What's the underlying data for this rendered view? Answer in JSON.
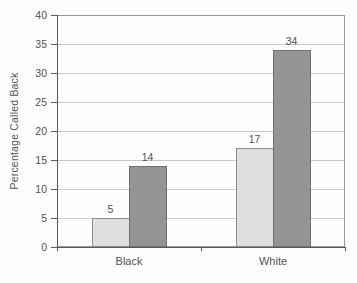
{
  "chart_data": {
    "type": "bar",
    "title": "",
    "xlabel": "",
    "ylabel": "Percentage Called Back",
    "ylim": [
      0,
      40
    ],
    "ytick_step": 5,
    "grid": true,
    "legend": "none",
    "bar_value_labels": true,
    "categories": [
      "Black",
      "White"
    ],
    "series": [
      {
        "name": "light-gray-bar",
        "color": "#dfdfdf",
        "border": "#8c8c8c",
        "values": [
          5,
          17
        ]
      },
      {
        "name": "dark-gray-bar",
        "color": "#949494",
        "border": "#6f6f6f",
        "values": [
          14,
          34
        ]
      }
    ]
  },
  "colors": {
    "background": "#fefefe",
    "grid": "#c9c9c9",
    "axis": "#5a5a5a",
    "box": "#979797",
    "text": "#515151"
  }
}
